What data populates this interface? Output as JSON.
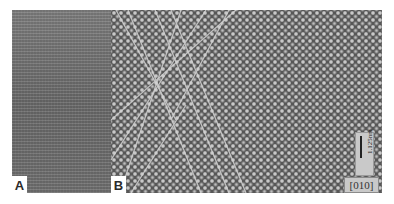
{
  "figure": {
    "panels": [
      {
        "id": "A",
        "label": "A",
        "description": "HRTEM image, fine horizontal lattice fringes"
      },
      {
        "id": "B",
        "label": "B",
        "description": "HRTEM image, atomic column lattice with crossing planar defects"
      }
    ],
    "scale_bar": {
      "label": "1.125nm"
    },
    "zone_axis": {
      "label": "[010]"
    },
    "colors": {
      "background": "#ffffff",
      "panel_a": "#6e6e6e",
      "panel_b": "#575757",
      "atoms": "#c8c8c8",
      "defect_lines": "#d0d0d0"
    }
  }
}
